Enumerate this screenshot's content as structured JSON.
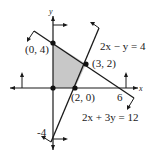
{
  "diagram": {
    "type": "linear-programming-feasible-region",
    "axes": {
      "x_label": "x",
      "y_label": "y"
    },
    "tick_labels": {
      "x": "6",
      "y": "-4"
    },
    "feasible_region_fill": "#c8c8c8",
    "vertices": [
      {
        "label": "(0, 4)",
        "x": 0,
        "y": 4
      },
      {
        "label": "(3, 2)",
        "x": 3,
        "y": 2
      },
      {
        "label": "(2, 0)",
        "x": 2,
        "y": 0
      },
      {
        "label": "",
        "x": 0,
        "y": 0
      }
    ],
    "lines": [
      {
        "equation": "2x − y = 4"
      },
      {
        "equation": "2x + 3y = 12"
      }
    ]
  }
}
